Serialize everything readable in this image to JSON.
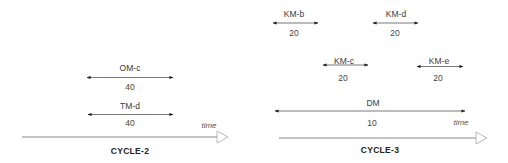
{
  "panels": [
    {
      "title": "CYCLE-2",
      "axis_label": "time",
      "intervals": [
        {
          "label": "OM-c",
          "value": "40"
        },
        {
          "label": "TM-d",
          "value": "40"
        }
      ]
    },
    {
      "title": "CYCLE-3",
      "axis_label": "time",
      "intervals": [
        {
          "label": "KM-b",
          "value": "20"
        },
        {
          "label": "KM-d",
          "value": "20"
        },
        {
          "label": "KM-c",
          "value": "20"
        },
        {
          "label": "KM-e",
          "value": "20"
        },
        {
          "label": "DM",
          "value": "10"
        }
      ]
    }
  ]
}
